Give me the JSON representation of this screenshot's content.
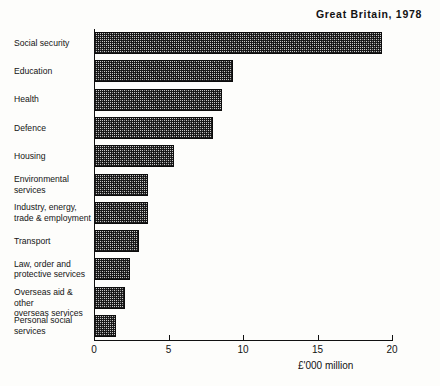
{
  "chart_data": {
    "type": "bar",
    "orientation": "horizontal",
    "title": "Great Britain, 1978",
    "xlabel": "£'000 million",
    "ylabel": "",
    "xlim": [
      0,
      20
    ],
    "xticks": [
      0,
      5,
      10,
      15,
      20
    ],
    "xtick_labels": [
      "0",
      "5",
      "10",
      "15",
      "20"
    ],
    "grid": false,
    "legend": null,
    "categories": [
      "Social security",
      "Education",
      "Health",
      "Defence",
      "Housing",
      "Environmental\nservices",
      "Industry, energy,\ntrade & employment",
      "Transport",
      "Law, order and\nprotective services",
      "Overseas aid & other\noverseas services",
      "Personal social\nservices"
    ],
    "values": [
      19.3,
      9.3,
      8.6,
      8.0,
      5.4,
      3.6,
      3.6,
      3.0,
      2.4,
      2.1,
      1.5
    ],
    "bar_fill": "#c9c9c9",
    "bar_edge": "#0c0c0c",
    "bar_hatch": "crosshatch",
    "background": "#fdfdfb"
  },
  "axis": {
    "x_title": "£'000 million"
  }
}
